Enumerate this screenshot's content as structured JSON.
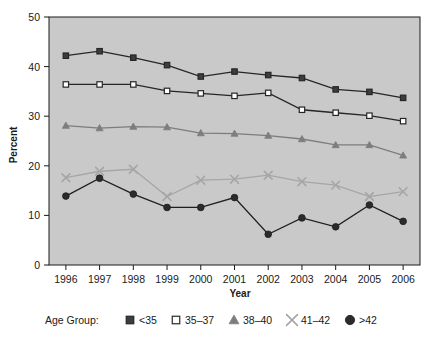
{
  "chart_data": {
    "type": "line",
    "title": "",
    "xlabel": "Year",
    "ylabel": "Percent",
    "categories": [
      1996,
      1997,
      1998,
      1999,
      2000,
      2001,
      2002,
      2003,
      2004,
      2005,
      2006
    ],
    "xtick_labels": [
      "1996",
      "1997",
      "1998",
      "1999",
      "2000",
      "2001",
      "2002",
      "2003",
      "2004",
      "2005",
      "2006"
    ],
    "ytick_labels": [
      "0",
      "10",
      "20",
      "30",
      "40",
      "50"
    ],
    "yticks": [
      0,
      10,
      20,
      30,
      40,
      50
    ],
    "ylim": [
      0,
      50
    ],
    "grid": false,
    "legend_position": "below",
    "legend_title": "Age Group:",
    "series": [
      {
        "name": "<35",
        "marker": "filled-square",
        "color": "#3d3d3d",
        "line_color": "#262626",
        "values": [
          42.2,
          43.1,
          41.8,
          40.3,
          38.0,
          39.0,
          38.3,
          37.7,
          35.4,
          34.9,
          33.7
        ]
      },
      {
        "name": "35–37",
        "marker": "open-square",
        "color": "#ffffff",
        "line_color": "#262626",
        "values": [
          36.4,
          36.4,
          36.4,
          35.1,
          34.6,
          34.1,
          34.7,
          31.3,
          30.7,
          30.1,
          29.0
        ]
      },
      {
        "name": "38–40",
        "marker": "filled-triangle",
        "color": "#7d7d7d",
        "line_color": "#7d7d7d",
        "values": [
          28.1,
          27.6,
          27.9,
          27.8,
          26.6,
          26.5,
          26.1,
          25.4,
          24.2,
          24.2,
          22.1
        ]
      },
      {
        "name": "41–42",
        "marker": "cross-x",
        "color": "#a6a6a6",
        "line_color": "#a6a6a6",
        "values": [
          17.6,
          18.9,
          19.3,
          13.8,
          17.1,
          17.3,
          18.1,
          16.8,
          16.1,
          13.8,
          14.8
        ]
      },
      {
        "name": ">42",
        "marker": "filled-circle",
        "color": "#2b2b2b",
        "line_color": "#1f1f1f",
        "values": [
          13.9,
          17.5,
          14.3,
          11.6,
          11.6,
          13.6,
          6.2,
          9.5,
          7.7,
          12.1,
          8.8
        ]
      }
    ]
  },
  "style": {
    "plot_background": "#c9c9c9",
    "page_background": "#ffffff",
    "axis_color": "#1a1a1a"
  }
}
